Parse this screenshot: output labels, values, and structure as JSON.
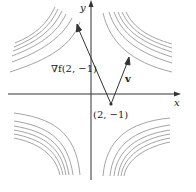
{
  "diagram": {
    "axes": {
      "x_label": "x",
      "y_label": "y"
    },
    "point_label": "(2, −1)",
    "gradient_label": "∇f(2, −1)",
    "vector_label": "v",
    "colors": {
      "curves": "#9a9a9a",
      "axes": "#333333",
      "vectors": "#333333"
    }
  }
}
